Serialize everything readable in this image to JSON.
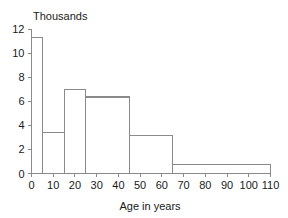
{
  "chart_data": {
    "type": "bar",
    "title": "Thousands",
    "xlabel": "Age in years",
    "ylabel": "",
    "categories": [
      "0-5",
      "5-15",
      "15-25",
      "25-45",
      "45-65",
      "65-110"
    ],
    "bin_edges": [
      0,
      5,
      15,
      25,
      45,
      65,
      110
    ],
    "values": [
      11.3,
      3.4,
      7.0,
      6.35,
      3.15,
      0.75
    ],
    "xlim": [
      0,
      110
    ],
    "ylim": [
      0,
      12
    ],
    "xticks": [
      0,
      10,
      20,
      30,
      40,
      50,
      60,
      70,
      80,
      90,
      100,
      110
    ],
    "xtick_labels": [
      "0",
      "10",
      "20",
      "30",
      "40",
      "50",
      "60",
      "70",
      "80",
      "90",
      "100",
      "110"
    ],
    "yticks": [
      0,
      2,
      4,
      6,
      8,
      10,
      12
    ],
    "ytick_labels": [
      "0",
      "2",
      "4",
      "6",
      "8",
      "10",
      "12"
    ],
    "grid": false,
    "legend": null,
    "bar_fill_color": "#ffffff",
    "bar_stroke_color": "#8a8a8a",
    "axis_color": "#8a8a8a",
    "text_color": "#1a1a1a",
    "background_color": "#ffffff"
  }
}
